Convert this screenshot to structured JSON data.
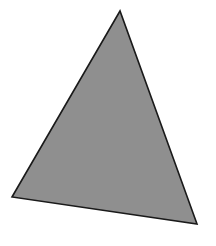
{
  "canvas": {
    "width": 216,
    "height": 246,
    "background": "#ffffff"
  },
  "shape": {
    "type": "triangle",
    "vertices": [
      {
        "name": "top",
        "x": 120,
        "y": 11
      },
      {
        "name": "bottom-left",
        "x": 12,
        "y": 197
      },
      {
        "name": "bottom-right",
        "x": 197,
        "y": 224
      }
    ],
    "fill": "#8f8f8f",
    "stroke": "#1a1a1a",
    "stroke_width": 1.6
  }
}
